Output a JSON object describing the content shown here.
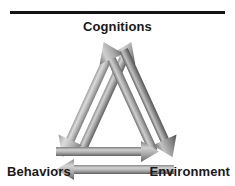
{
  "figure": {
    "background_color": "#ffffff",
    "rule_color": "#141414",
    "label_color": "#191919"
  },
  "nodes": {
    "top": "Cognitions",
    "bottom_left": "Behaviors",
    "bottom_right": "Environment"
  },
  "arrows": [
    {
      "id": "behaviors-to-cognitions",
      "from": "Behaviors",
      "to": "Cognitions",
      "direction": "up-right",
      "side": "left",
      "fill_light": "#bdbdbd",
      "fill_dark": "#6e6e6e"
    },
    {
      "id": "cognitions-to-behaviors",
      "from": "Cognitions",
      "to": "Behaviors",
      "direction": "down-left",
      "side": "left",
      "fill_light": "#c8c8c8",
      "fill_dark": "#8c8c8c"
    },
    {
      "id": "environment-to-cognitions",
      "from": "Environment",
      "to": "Cognitions",
      "direction": "up-left",
      "side": "right",
      "fill_light": "#bdbdbd",
      "fill_dark": "#777777"
    },
    {
      "id": "cognitions-to-environment",
      "from": "Cognitions",
      "to": "Environment",
      "direction": "down-right",
      "side": "right",
      "fill_light": "#b4b4b4",
      "fill_dark": "#5f5f5f"
    },
    {
      "id": "behaviors-to-environment",
      "from": "Behaviors",
      "to": "Environment",
      "direction": "right",
      "side": "bottom",
      "fill_light": "#c0c0c0",
      "fill_dark": "#707070"
    },
    {
      "id": "environment-to-behaviors",
      "from": "Environment",
      "to": "Behaviors",
      "direction": "left",
      "side": "bottom",
      "fill_light": "#c4c4c4",
      "fill_dark": "#6b6b6b"
    }
  ]
}
